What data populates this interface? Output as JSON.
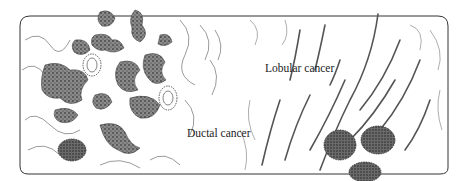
{
  "figure": {
    "labels": {
      "ductal": "Ductal cancer",
      "lobular": "Lobular cancer"
    },
    "colors": {
      "ink": "#2a2a2a",
      "tumor_fill": "#7a7a7a",
      "background": "#ffffff"
    }
  }
}
